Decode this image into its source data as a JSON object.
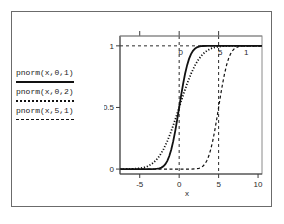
{
  "chart_data": {
    "type": "line",
    "title": "",
    "xlabel": "x",
    "ylabel": "",
    "xlim": [
      -7.5,
      10.5
    ],
    "ylim": [
      -0.04,
      1.08
    ],
    "xticks": [
      "-5",
      "0",
      "5",
      "10"
    ],
    "xtick_values": [
      -5,
      0,
      5,
      10
    ],
    "yticks": [
      "0",
      "0.5",
      "1"
    ],
    "ytick_values": [
      0,
      0.5,
      1
    ],
    "grid": false,
    "legend_position": "left-outside",
    "annotations": [
      {
        "text": "0",
        "x": 0,
        "y": 1.0,
        "kind": "vertical-reference-label"
      },
      {
        "text": "5",
        "x": 5,
        "y": 1.0,
        "kind": "vertical-reference-label"
      },
      {
        "text": "1",
        "x": 8.3,
        "y": 1.0,
        "kind": "horizontal-reference-label"
      }
    ],
    "reference_lines": [
      {
        "orientation": "vertical",
        "value": 0,
        "style": "dashed"
      },
      {
        "orientation": "vertical",
        "value": 5,
        "style": "dashed"
      },
      {
        "orientation": "horizontal",
        "value": 1,
        "style": "dashed"
      }
    ],
    "series": [
      {
        "name": "pnorm(x,0,1)",
        "style": "solid",
        "mean": 0,
        "sd": 1,
        "x": [
          -7.5,
          -7,
          -6.5,
          -6,
          -5.5,
          -5,
          -4.5,
          -4,
          -3.5,
          -3,
          -2.75,
          -2.5,
          -2.25,
          -2,
          -1.75,
          -1.5,
          -1.25,
          -1,
          -0.75,
          -0.5,
          -0.25,
          0,
          0.25,
          0.5,
          0.75,
          1,
          1.25,
          1.5,
          1.75,
          2,
          2.25,
          2.5,
          2.75,
          3,
          3.5,
          4,
          4.5,
          5,
          6,
          7,
          8,
          9,
          10,
          10.5
        ],
        "y": [
          0,
          0,
          0,
          0,
          0,
          0,
          0,
          0,
          0.0002,
          0.0013,
          0.003,
          0.0062,
          0.0122,
          0.0228,
          0.0401,
          0.0668,
          0.1056,
          0.1587,
          0.2266,
          0.3085,
          0.4013,
          0.5,
          0.5987,
          0.6915,
          0.7734,
          0.8413,
          0.8944,
          0.9332,
          0.9599,
          0.9772,
          0.9878,
          0.9938,
          0.997,
          0.9987,
          0.9998,
          1,
          1,
          1,
          1,
          1,
          1,
          1,
          1,
          1
        ]
      },
      {
        "name": "pnorm(x,0,2)",
        "style": "dotted",
        "mean": 0,
        "sd": 2,
        "x": [
          -7.5,
          -7,
          -6.5,
          -6,
          -5.5,
          -5,
          -4.5,
          -4,
          -3.5,
          -3,
          -2.5,
          -2,
          -1.5,
          -1,
          -0.5,
          0,
          0.5,
          1,
          1.5,
          2,
          2.5,
          3,
          3.5,
          4,
          4.5,
          5,
          5.5,
          6,
          6.5,
          7,
          7.5,
          8,
          9,
          10,
          10.5
        ],
        "y": [
          0.0001,
          0.0002,
          0.0006,
          0.0013,
          0.003,
          0.0062,
          0.0122,
          0.0228,
          0.0401,
          0.0668,
          0.1056,
          0.1587,
          0.2266,
          0.3085,
          0.4013,
          0.5,
          0.5987,
          0.6915,
          0.7734,
          0.8413,
          0.8944,
          0.9332,
          0.9599,
          0.9772,
          0.9878,
          0.9938,
          0.997,
          0.9987,
          0.9994,
          0.9998,
          0.9999,
          1,
          1,
          1,
          1
        ]
      },
      {
        "name": "pnorm(x,5,1)",
        "style": "dashed",
        "mean": 5,
        "sd": 1,
        "x": [
          -7.5,
          -2,
          0,
          1,
          1.5,
          2,
          2.25,
          2.5,
          2.75,
          3,
          3.25,
          3.5,
          3.75,
          4,
          4.25,
          4.5,
          4.75,
          5,
          5.25,
          5.5,
          5.75,
          6,
          6.25,
          6.5,
          6.75,
          7,
          7.5,
          8,
          8.5,
          9,
          10,
          10.5
        ],
        "y": [
          0,
          0,
          0,
          0,
          0.0002,
          0.0013,
          0.003,
          0.0062,
          0.0122,
          0.0228,
          0.0401,
          0.0668,
          0.1056,
          0.1587,
          0.2266,
          0.3085,
          0.4013,
          0.5,
          0.5987,
          0.6915,
          0.7734,
          0.8413,
          0.8944,
          0.9332,
          0.9599,
          0.9772,
          0.9938,
          0.9987,
          0.9998,
          1,
          1,
          1
        ]
      }
    ]
  },
  "legend": {
    "entries": [
      {
        "label": "pnorm(x,0,1)",
        "style": "solid"
      },
      {
        "label": "pnorm(x,0,2)",
        "style": "dotted"
      },
      {
        "label": "pnorm(x,5,1)",
        "style": "dashed"
      }
    ]
  },
  "colors": {
    "curve": "#111111",
    "axis": "#3c3c3c",
    "frame": "#6b6b6b",
    "panel": "#8a8a8a",
    "background": "#ffffff"
  }
}
